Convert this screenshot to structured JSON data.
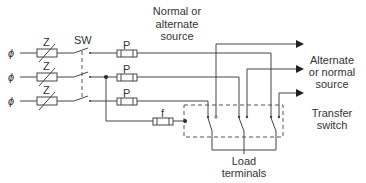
{
  "diagram": {
    "type": "transfer-switch schematic",
    "phase_symbol": "ϕ",
    "impedance_label": "Z",
    "switch_label": "SW",
    "fuse_label": "P",
    "small_fuse_label": "f",
    "labels": {
      "normal_source": [
        "Normal or",
        "alternate",
        "source"
      ],
      "alternate_source": [
        "Alternate",
        "or normal",
        "source"
      ],
      "transfer_switch": [
        "Transfer",
        "switch"
      ],
      "load_terminals": [
        "Load",
        "terminals"
      ]
    },
    "colors": {
      "line": "#444444",
      "text": "#333333",
      "background": "#ffffff"
    }
  }
}
